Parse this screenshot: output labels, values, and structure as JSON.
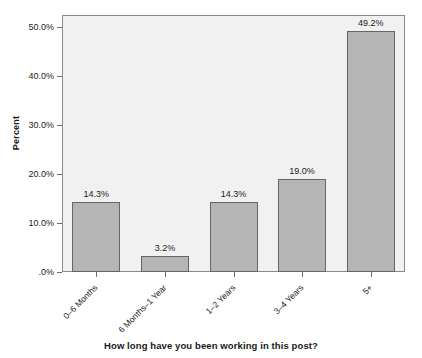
{
  "chart_data": {
    "type": "bar",
    "title": "",
    "subtitle": "",
    "xlabel": "How long have you been working in this post?",
    "ylabel": "Percent",
    "categories": [
      "0–6 Months",
      "6 Months–1 Year",
      "1–2 Years",
      "3–4 Years",
      "5+"
    ],
    "values": [
      14.3,
      3.2,
      14.3,
      19.0,
      49.2
    ],
    "data_labels": [
      "14.3%",
      "3.2%",
      "14.3%",
      "19.0%",
      "49.2%"
    ],
    "ylim": [
      0,
      52.5
    ],
    "ytick_values": [
      0,
      10,
      20,
      30,
      40,
      50
    ],
    "ytick_labels": [
      ".0%",
      "10.0%",
      "20.0%",
      "30.0%",
      "40.0%",
      "50.0%"
    ],
    "grid": false,
    "legend": null,
    "legend_position": "none",
    "bar_color": "#b5b5b5",
    "bar_edge_color": "#666666",
    "plot_background": "#f1f1f1",
    "plot_border_color": "#8a8a8a",
    "page_background": "#ffffff",
    "text_color": "#1a1a1a"
  }
}
